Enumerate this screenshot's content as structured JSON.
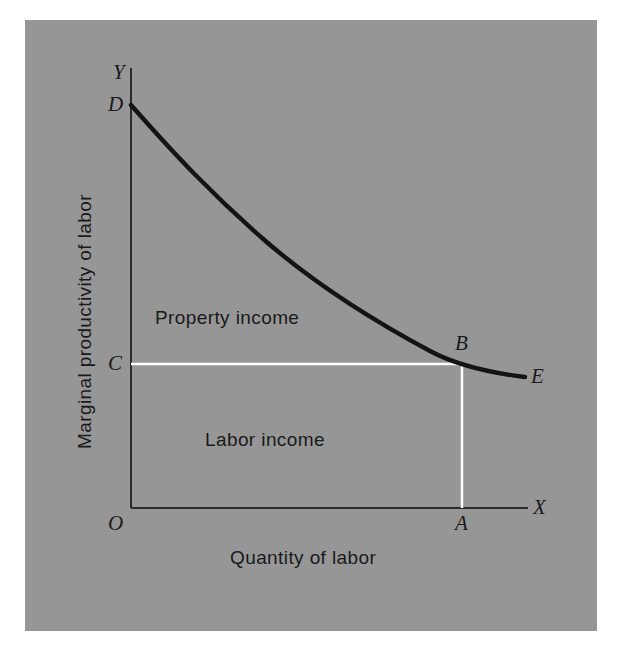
{
  "figure": {
    "background_color": "#969696",
    "page_color": "#ffffff",
    "curve_color": "#141414",
    "axis_color": "#2b2b2b",
    "highlight_line_color": "#ffffff",
    "axes": {
      "y_title": "Marginal productivity of labor",
      "x_title": "Quantity of labor",
      "y_axis_tip_label": "Y",
      "x_axis_tip_label": "X",
      "origin_label": "O"
    },
    "points": [
      {
        "label": "D",
        "meaning": "curve-start-on-y-axis",
        "x": 131,
        "y": 105
      },
      {
        "label": "C",
        "meaning": "wage-rate-on-y-axis",
        "x": 131,
        "y": 364
      },
      {
        "label": "B",
        "meaning": "equilibrium-on-curve",
        "x": 462,
        "y": 364
      },
      {
        "label": "A",
        "meaning": "employment-on-x-axis",
        "x": 462,
        "y": 508
      },
      {
        "label": "E",
        "meaning": "curve-end",
        "x": 525,
        "y": 377
      }
    ],
    "regions": [
      {
        "label": "Property income",
        "x": 155,
        "y": 318
      },
      {
        "label": "Labor income",
        "x": 205,
        "y": 440
      }
    ],
    "curve": {
      "name": "marginal-productivity-curve",
      "description": "downward sloping convex curve from D to E",
      "path_points": [
        [
          131,
          105
        ],
        [
          160,
          137
        ],
        [
          192,
          171
        ],
        [
          226,
          205
        ],
        [
          262,
          238
        ],
        [
          300,
          269
        ],
        [
          340,
          297
        ],
        [
          381,
          322
        ],
        [
          422,
          345
        ],
        [
          462,
          364
        ],
        [
          495,
          372
        ],
        [
          525,
          377
        ]
      ]
    },
    "guide_lines": [
      {
        "name": "wage-line-CB",
        "from": [
          131,
          364
        ],
        "to": [
          462,
          364
        ],
        "color": "#ffffff"
      },
      {
        "name": "employment-line-AB",
        "from": [
          462,
          364
        ],
        "to": [
          462,
          508
        ],
        "color": "#ffffff"
      }
    ],
    "axis_lines": [
      {
        "name": "y-axis",
        "from": [
          131,
          68
        ],
        "to": [
          131,
          508
        ]
      },
      {
        "name": "x-axis",
        "from": [
          131,
          508
        ],
        "to": [
          528,
          508
        ]
      }
    ]
  }
}
